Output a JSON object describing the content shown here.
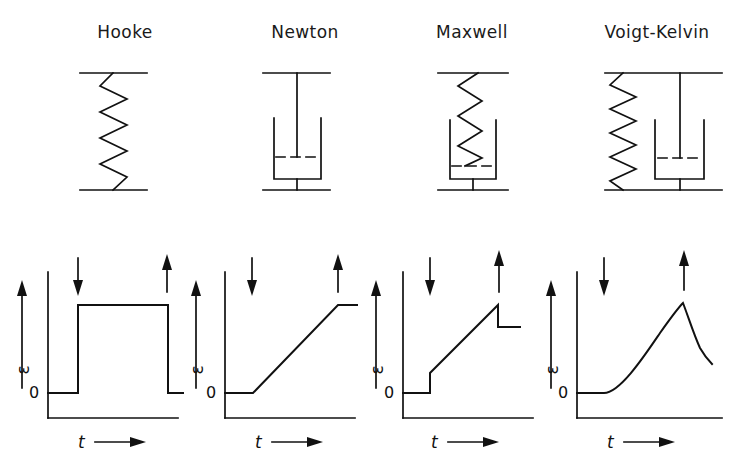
{
  "figure": {
    "kind": "mechanical-models-and-strain-time-curves",
    "background_color": "#ffffff",
    "line_color": "#111111",
    "panel_count": 4
  },
  "titles": [
    {
      "label": "Hooke",
      "center_x": 125
    },
    {
      "label": "Newton",
      "center_x": 305
    },
    {
      "label": "Maxwell",
      "center_x": 472
    },
    {
      "label": "Voigt-Kelvin",
      "center_x": 657
    }
  ],
  "models": [
    {
      "name": "hooke",
      "title": "Hooke",
      "elements": [
        "spring"
      ],
      "arrangement": "single-spring",
      "description": "Elastic spring element between two rigid bars"
    },
    {
      "name": "newton",
      "title": "Newton",
      "elements": [
        "dashpot"
      ],
      "arrangement": "single-dashpot",
      "description": "Viscous dashpot: piston rod in cup of fluid"
    },
    {
      "name": "maxwell",
      "title": "Maxwell",
      "elements": [
        "spring",
        "dashpot"
      ],
      "arrangement": "series",
      "description": "Spring in series with dashpot"
    },
    {
      "name": "voigt-kelvin",
      "title": "Voigt-Kelvin",
      "elements": [
        "spring",
        "dashpot"
      ],
      "arrangement": "parallel",
      "description": "Spring in parallel with dashpot"
    }
  ],
  "graphs": {
    "y_axis_symbol": "ε",
    "x_axis_symbol": "t",
    "origin_label": "0",
    "x_axis_arrow": "⟶",
    "load_on_arrow": "down-arrow",
    "load_off_arrow": "up-arrow",
    "panels": [
      {
        "name": "hooke-strain-curve",
        "title": "Hooke",
        "curve_type": "step",
        "description": "Instant strain on loading, constant strain, instant full recovery on unloading",
        "load_on_t": 0.25,
        "load_off_t": 1.0,
        "points": [
          [
            0,
            0
          ],
          [
            0.25,
            0
          ],
          [
            0.25,
            1.0
          ],
          [
            1.0,
            1.0
          ],
          [
            1.0,
            0
          ],
          [
            1.25,
            0
          ]
        ],
        "residual_strain": 0.0
      },
      {
        "name": "newton-strain-curve",
        "title": "Newton",
        "curve_type": "ramp",
        "description": "Linear viscous flow during loading, full permanent deformation retained",
        "load_on_t": 0.25,
        "load_off_t": 1.0,
        "points": [
          [
            0,
            0
          ],
          [
            0.25,
            0
          ],
          [
            1.0,
            1.0
          ],
          [
            1.3,
            1.0
          ]
        ],
        "residual_strain": 1.0
      },
      {
        "name": "maxwell-strain-curve",
        "title": "Maxwell",
        "curve_type": "step-plus-ramp",
        "description": "Instant elastic jump, linear creep, instant elastic recovery, permanent residual strain",
        "load_on_t": 0.25,
        "load_off_t": 1.0,
        "elastic_jump": 0.18,
        "points": [
          [
            0,
            0
          ],
          [
            0.25,
            0
          ],
          [
            0.25,
            0.18
          ],
          [
            1.0,
            1.0
          ],
          [
            1.0,
            0.8
          ],
          [
            1.3,
            0.8
          ]
        ],
        "residual_strain": 0.8
      },
      {
        "name": "voigt-kelvin-strain-curve",
        "title": "Voigt-Kelvin",
        "curve_type": "exponential-creep-recovery",
        "description": "Retarded exponential creep on loading, exponential recovery toward zero on unloading",
        "load_on_t": 0.25,
        "load_off_t": 1.0,
        "points": [
          [
            0,
            0
          ],
          [
            0.25,
            0
          ],
          [
            1.0,
            1.0
          ],
          [
            1.35,
            0.45
          ]
        ],
        "residual_strain": 0.0
      }
    ]
  }
}
